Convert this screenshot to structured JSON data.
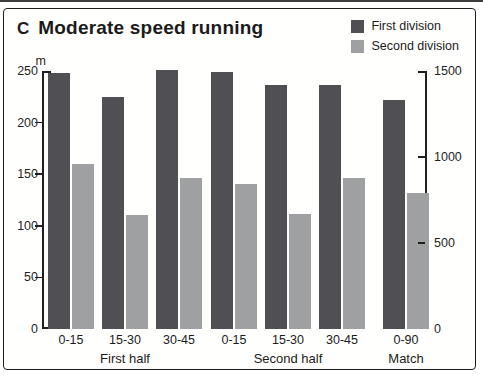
{
  "panel": {
    "letter": "C",
    "title": "Moderate speed running"
  },
  "legend": {
    "items": [
      {
        "label": "First division",
        "color": "#4f4f54"
      },
      {
        "label": "Second division",
        "color": "#9fa0a2"
      }
    ]
  },
  "left_axis": {
    "unit": "m",
    "max": 250,
    "tick_labels": [
      0,
      50,
      100,
      150,
      200,
      250
    ],
    "tick_marks": [
      50,
      100,
      150,
      200
    ]
  },
  "right_axis": {
    "max": 1500,
    "tick_labels": [
      0,
      500,
      1000,
      1500
    ],
    "tick_marks": [
      500,
      1000
    ]
  },
  "chart_data": {
    "type": "bar",
    "title": "Moderate speed running",
    "ylabel_left": "m (per period, halves)",
    "ylabel_right": "m (match total)",
    "ylim_left": [
      0,
      250
    ],
    "ylim_right": [
      0,
      1500
    ],
    "legend_position": "top-right",
    "series": [
      {
        "name": "First division",
        "color": "#4f4f54"
      },
      {
        "name": "Second division",
        "color": "#9fa0a2"
      }
    ],
    "groups": [
      {
        "label": "First half",
        "axis": "left",
        "bars": [
          {
            "category": "0-15",
            "first_division": 248,
            "second_division": 160
          },
          {
            "category": "15-30",
            "first_division": 225,
            "second_division": 110
          },
          {
            "category": "30-45",
            "first_division": 251,
            "second_division": 146
          }
        ]
      },
      {
        "label": "Second half",
        "axis": "left",
        "bars": [
          {
            "category": "0-15",
            "first_division": 249,
            "second_division": 141
          },
          {
            "category": "15-30",
            "first_division": 236,
            "second_division": 111
          },
          {
            "category": "30-45",
            "first_division": 236,
            "second_division": 146
          }
        ]
      },
      {
        "label": "Match",
        "axis": "right",
        "separator_before": true,
        "bars": [
          {
            "category": "0-90",
            "first_division": 1330,
            "second_division": 790
          }
        ]
      }
    ]
  }
}
